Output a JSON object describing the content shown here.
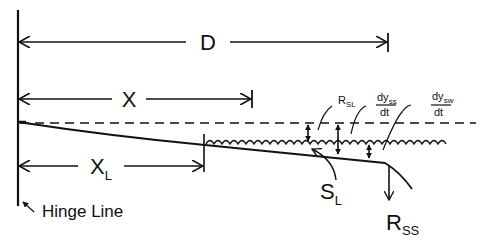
{
  "diagram": {
    "colors": {
      "line": "#111111",
      "background": "#ffffff"
    },
    "dimensions": {
      "D": {
        "label": "D"
      },
      "X": {
        "label": "X"
      },
      "XL": {
        "label": "X",
        "subscript": "L"
      }
    },
    "labels": {
      "hinge_line": "Hinge Line",
      "SL": {
        "main": "S",
        "subscript": "L"
      },
      "RSS": {
        "main": "R",
        "subscript": "SS"
      },
      "RSL": {
        "main": "R",
        "subscript": "SL"
      },
      "dyss_dt": {
        "numerator": "dy",
        "subscript": "ss",
        "denominator": "dt"
      },
      "dysw_dt": {
        "numerator": "dy",
        "subscript": "sw",
        "denominator": "dt"
      }
    }
  }
}
